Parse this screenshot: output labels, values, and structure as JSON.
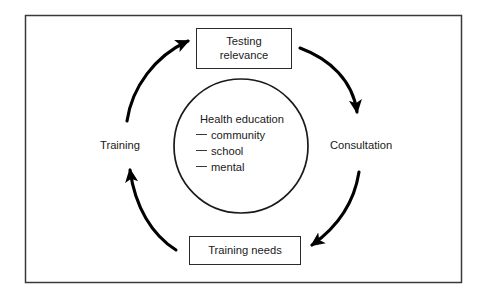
{
  "figure": {
    "type": "cycle-diagram",
    "frame": {
      "border_color": "#3a3a3a",
      "background": "#ffffff"
    },
    "center": {
      "heading": "Health education",
      "items": [
        "community",
        "school",
        "mental"
      ],
      "dash_glyph": "—"
    },
    "nodes": [
      {
        "id": "testing-relevance",
        "label": "Testing\nrelevance"
      },
      {
        "id": "training-needs",
        "label": "Training needs"
      }
    ],
    "edge_labels": [
      {
        "id": "training",
        "label": "Training"
      },
      {
        "id": "consultation",
        "label": "Consultation"
      }
    ],
    "arrows": [
      {
        "id": "arrow-training-to-testing",
        "from": "Training needs",
        "to": "Testing relevance",
        "direction": "up-right"
      },
      {
        "id": "arrow-testing-to-consultation",
        "from": "Testing relevance",
        "to": "Consultation",
        "direction": "down-right"
      },
      {
        "id": "arrow-consultation-to-training-needs",
        "from": "Consultation",
        "to": "Training needs",
        "direction": "down-left"
      },
      {
        "id": "arrow-training-needs-to-training",
        "from": "Training needs",
        "to": "Training",
        "direction": "up-left"
      }
    ],
    "stroke_color": "#000000"
  }
}
